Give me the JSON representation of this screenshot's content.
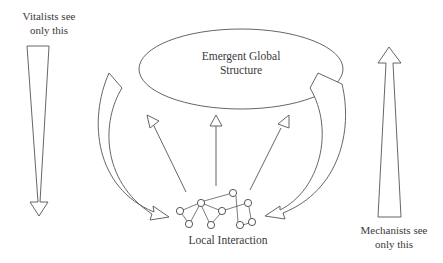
{
  "diagram": {
    "type": "emergence-perspectives",
    "labels": {
      "vitalists_line1": "Vitalists see",
      "vitalists_line2": "only this",
      "global_line1": "Emergent Global",
      "global_line2": "Structure",
      "local": "Local Interaction",
      "mechanists_line1": "Mechanists see",
      "mechanists_line2": "only this"
    },
    "nodes": [
      {
        "id": "global",
        "label": "Emergent Global Structure",
        "shape": "ellipse"
      },
      {
        "id": "local",
        "label": "Local Interaction",
        "shape": "network"
      }
    ],
    "edges": [
      {
        "from": "global",
        "to": "local",
        "style": "curved-block-arrow",
        "side": "left"
      },
      {
        "from": "global",
        "to": "local",
        "style": "curved-block-arrow",
        "side": "right"
      },
      {
        "from": "local",
        "to": "global",
        "style": "thin-arrow",
        "count": 3
      }
    ],
    "perspective_arrows": [
      {
        "label": "Vitalists see only this",
        "direction": "down",
        "side": "left"
      },
      {
        "label": "Mechanists see only this",
        "direction": "up",
        "side": "right"
      }
    ],
    "colors": {
      "stroke": "#555555",
      "background": "#ffffff",
      "text": "#3a3a3a"
    }
  }
}
